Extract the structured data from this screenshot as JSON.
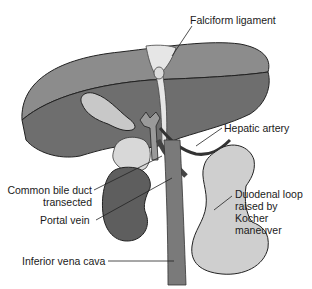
{
  "figure": {
    "labels": {
      "falciform_ligament": "Falciform ligament",
      "hepatic_artery": "Hepatic artery",
      "common_bile_duct_line1": "Common bile duct",
      "common_bile_duct_line2": "transected",
      "portal_vein": "Portal vein",
      "duodenal_loop_line1": "Duodenal loop",
      "duodenal_loop_line2": "raised by",
      "duodenal_loop_line3": "Kocher",
      "duodenal_loop_line4": "maneuver",
      "inferior_vena_cava": "Inferior vena cava"
    },
    "colors": {
      "liver_dark": "#6e6e6e",
      "liver_light": "#8a8a8a",
      "gallbladder": "#c8c8c8",
      "duodenum": "#cfcfcf",
      "vena_cava": "#7a7a7a",
      "kidney": "#5e5e5e",
      "outline": "#222222"
    }
  }
}
